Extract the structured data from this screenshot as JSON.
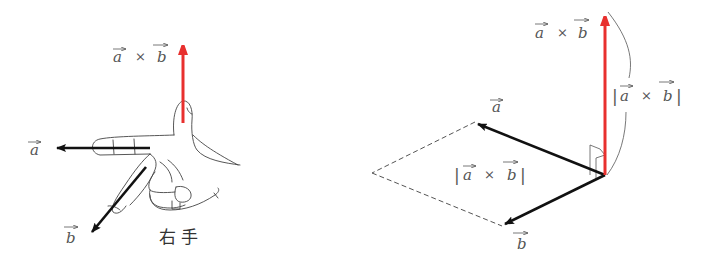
{
  "left_figure": {
    "caption": "右 手",
    "cross_label": {
      "a": "a",
      "times": "×",
      "b": "b"
    },
    "vector_a_label": "a",
    "vector_b_label": "b"
  },
  "right_figure": {
    "cross_label": {
      "a": "a",
      "times": "×",
      "b": "b"
    },
    "magnitude_label_vertical": {
      "open": "|",
      "a": "a",
      "times": "×",
      "b": "b",
      "close": "|"
    },
    "magnitude_label_area": {
      "open": "|",
      "a": "a",
      "times": "×",
      "b": "b",
      "close": "|"
    },
    "vector_a_label": "a",
    "vector_b_label": "b"
  },
  "colors": {
    "cross_product_arrow": "#e8302e",
    "vector_arrows": "#111111",
    "outline": "#444444",
    "dashed": "#555555"
  }
}
